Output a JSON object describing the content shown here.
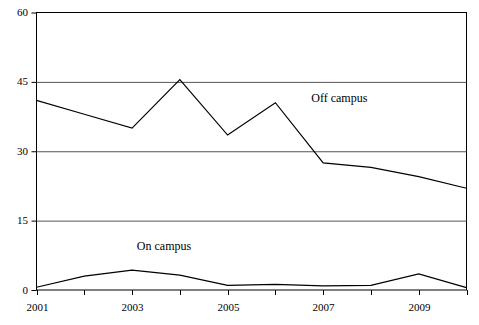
{
  "chart_data": {
    "type": "line",
    "title": "",
    "xlabel": "",
    "ylabel": "",
    "x": [
      2001,
      2002,
      2003,
      2004,
      2005,
      2006,
      2007,
      2008,
      2009,
      2010
    ],
    "xlim": [
      2001,
      2010
    ],
    "ylim": [
      0,
      60
    ],
    "yticks": [
      0,
      15,
      30,
      45,
      60
    ],
    "ytick_labels": [
      "0",
      "15",
      "30",
      "45",
      "60"
    ],
    "xticks": [
      2001,
      2002,
      2003,
      2004,
      2005,
      2006,
      2007,
      2008,
      2009,
      2010
    ],
    "xtick_labels": [
      "2001",
      "",
      "2003",
      "",
      "2005",
      "",
      "2007",
      "",
      "2009",
      ""
    ],
    "xtick_labels_visible": [
      "2001",
      "2003",
      "2005",
      "2007",
      "2009"
    ],
    "grid": "horizontal",
    "gridlines": [
      15,
      30,
      45
    ],
    "legend_position": "inline-annotation",
    "line_color": "#000000",
    "grid_color": "#555555",
    "axis_color": "#000000",
    "background": "#ffffff",
    "series": [
      {
        "name": "Off campus",
        "label_x": 2006.75,
        "label_y": 41.5,
        "values": [
          41,
          38,
          35,
          45.5,
          33.5,
          40.5,
          27.5,
          26.5,
          24.5,
          22
        ]
      },
      {
        "name": "On campus",
        "label_x": 2003.1,
        "label_y": 9.5,
        "values": [
          0.6,
          3.0,
          4.3,
          3.2,
          1.0,
          1.2,
          0.9,
          1.0,
          3.5,
          0.5
        ]
      }
    ]
  }
}
